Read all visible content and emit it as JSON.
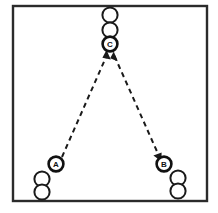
{
  "diagram": {
    "type": "sports-drill-diagram",
    "canvas": {
      "width": 218,
      "height": 213
    },
    "colors": {
      "background": "#ffffff",
      "border": "#2b2b2b",
      "stroke": "#1a1a1a",
      "fill": "#ffffff"
    },
    "border_rect": {
      "x": 13,
      "y": 6,
      "width": 194,
      "height": 195
    },
    "players": [
      {
        "id": "top-queue-1",
        "label": "",
        "cx": 110,
        "cy": 15,
        "r": 7.6,
        "labeled": false
      },
      {
        "id": "top-queue-2",
        "label": "",
        "cx": 110,
        "cy": 30,
        "r": 7.6,
        "labeled": false
      },
      {
        "id": "player-c",
        "label": "C",
        "cx": 110,
        "cy": 44,
        "r": 7.6,
        "labeled": true
      },
      {
        "id": "player-a",
        "label": "A",
        "cx": 56,
        "cy": 164,
        "r": 7.6,
        "labeled": true
      },
      {
        "id": "left-queue-1",
        "label": "",
        "cx": 42,
        "cy": 179,
        "r": 7.6,
        "labeled": false
      },
      {
        "id": "left-queue-2",
        "label": "",
        "cx": 42,
        "cy": 192,
        "r": 7.6,
        "labeled": false
      },
      {
        "id": "player-b",
        "label": "B",
        "cx": 164,
        "cy": 164,
        "r": 7.6,
        "labeled": true
      },
      {
        "id": "right-queue-1",
        "label": "",
        "cx": 178,
        "cy": 178,
        "r": 7.6,
        "labeled": false
      },
      {
        "id": "right-queue-2",
        "label": "",
        "cx": 178,
        "cy": 191,
        "r": 7.6,
        "labeled": false
      }
    ],
    "movements": [
      {
        "id": "path-a-to-c",
        "from": "player-a",
        "to": "player-c",
        "style": "dashed",
        "x1": 62,
        "y1": 157,
        "x2": 106,
        "y2": 55,
        "arrow_at": "end",
        "arrow_angle_deg": -113
      },
      {
        "id": "path-c-to-b",
        "from": "player-c",
        "to": "player-b",
        "style": "dashed",
        "x1": 115,
        "y1": 55,
        "x2": 159,
        "y2": 156,
        "arrow_at": "end",
        "arrow_angle_deg": 66
      },
      {
        "id": "arrow-into-c-right",
        "from": "player-b",
        "to": "player-c",
        "style": "arrowhead-only",
        "x1": 118,
        "y1": 62,
        "x2": 113,
        "y2": 54,
        "arrow_at": "end",
        "arrow_angle_deg": -58
      }
    ]
  }
}
